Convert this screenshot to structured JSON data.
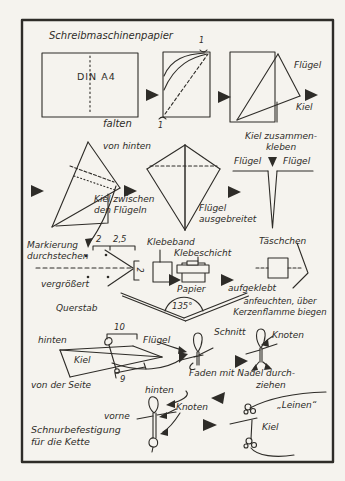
{
  "colors": {
    "ink": "#2e2c28",
    "paper": "#f5f3ee"
  },
  "labels": {
    "row1": {
      "title": "Schreibmaschinenpapier",
      "din_a4": "DIN A4",
      "falten": "falten",
      "fluegel": "Flügel",
      "kiel": "Kiel",
      "fold_mark_top": "1",
      "fold_mark_bottom": "1"
    },
    "row2": {
      "von_hinten": "von hinten",
      "kiel_zwischen": "Kiel zwischen\nden Flügeln",
      "fluegel_ausgebreitet": "Flügel\nausgebreitet",
      "kiel_zusammenkleben": "Kiel zusammen-\nkleben",
      "fluegel_links": "Flügel",
      "fluegel_rechts": "Flügel"
    },
    "row3": {
      "mass_2": "2",
      "mass_2_5": "2,5",
      "markierung": "Markierung\ndurchstechen",
      "vergroessert": "vergrößert",
      "bracket_mass": "2",
      "klebeband": "Klebeband",
      "klebeschicht": "Klebeschicht",
      "papier": "Papier",
      "aufgeklebt": "aufgeklebt",
      "taeschchen": "Täschchen",
      "querstab": "Querstab",
      "winkel": "135°",
      "anfeuchten": "anfeuchten, über\nKerzenflamme biegen"
    },
    "row4": {
      "mass_10": "10",
      "hinten": "hinten",
      "kiel": "Kiel",
      "fluegel": "Flügel",
      "mass_9": "9",
      "von_der_seite": "von der Seite",
      "schnitt": "Schnitt",
      "knoten": "Knoten",
      "faden_1": "Faden mit Nadel durch-",
      "faden_2": "ziehen"
    },
    "row5": {
      "hinten": "hinten",
      "knoten": "Knoten",
      "vorne": "vorne",
      "schnurbefestigung": "Schnurbefestigung\nfür die Kette",
      "leinen": "„Leinen“",
      "kiel": "Kiel"
    }
  }
}
